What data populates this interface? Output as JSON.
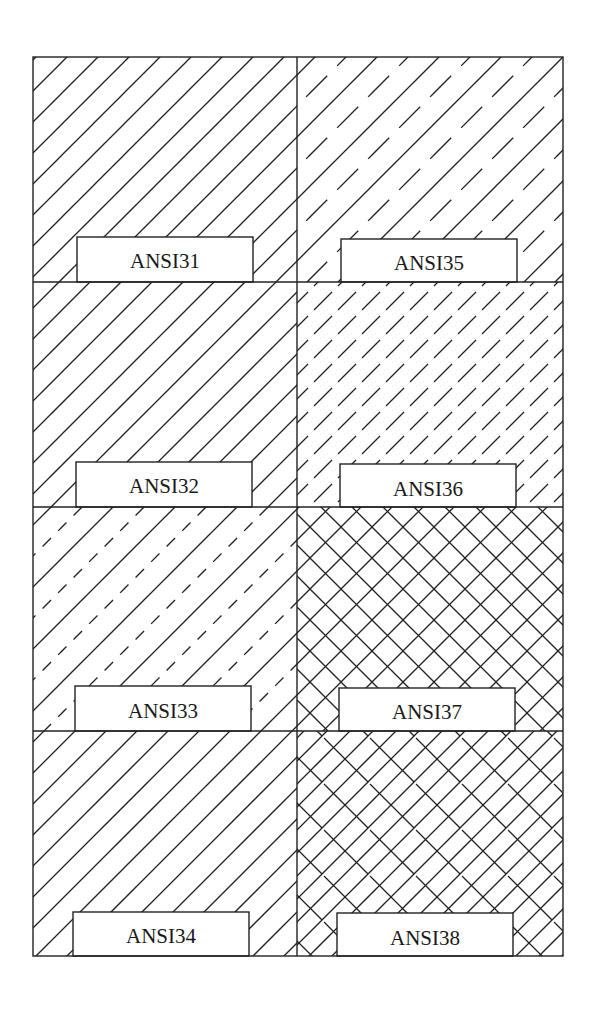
{
  "figure": {
    "line_color": "#222222",
    "background": "#ffffff",
    "frame": {
      "left": 33,
      "top": 57,
      "right": 563,
      "bottom": 956,
      "column_split": 297,
      "row_splits": [
        282,
        507,
        731
      ]
    }
  },
  "cells": [
    {
      "id": "ansi31",
      "label": "ANSI31",
      "column": 0,
      "row": 0,
      "pattern": "single-continuous-45deg",
      "description": "Iron, brick, stone masonry"
    },
    {
      "id": "ansi32",
      "label": "ANSI32",
      "column": 0,
      "row": 1,
      "pattern": "double-line-45deg-wide-gap"
    },
    {
      "id": "ansi33",
      "label": "ANSI33",
      "column": 0,
      "row": 2,
      "pattern": "alternating-continuous-and-dashed-45deg"
    },
    {
      "id": "ansi34",
      "label": "ANSI34",
      "column": 0,
      "row": 3,
      "pattern": "quad-line-band-45deg"
    },
    {
      "id": "ansi35",
      "label": "ANSI35",
      "column": 1,
      "row": 0,
      "pattern": "alternating-continuous-and-long-dash-45deg"
    },
    {
      "id": "ansi36",
      "label": "ANSI36",
      "column": 1,
      "row": 1,
      "pattern": "staggered-dashes-45deg"
    },
    {
      "id": "ansi37",
      "label": "ANSI37",
      "column": 1,
      "row": 2,
      "pattern": "crosshatch-45deg"
    },
    {
      "id": "ansi38",
      "label": "ANSI38",
      "column": 1,
      "row": 3,
      "pattern": "crosshatch-45deg-with-interrupted-lines"
    }
  ]
}
